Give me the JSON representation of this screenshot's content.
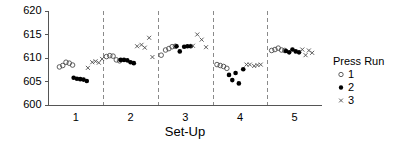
{
  "chart_data": {
    "type": "scatter",
    "title": "",
    "xlabel": "Set-Up",
    "ylabel": "",
    "xlim": [
      0.5,
      5.5
    ],
    "ylim": [
      600,
      620
    ],
    "grid": false,
    "x_tick_labels": [
      "1",
      "2",
      "3",
      "4",
      "5"
    ],
    "x_tick_values": [
      1,
      2,
      3,
      4,
      5
    ],
    "y_tick_labels": [
      "600",
      "605",
      "610",
      "615",
      "620"
    ],
    "y_tick_values": [
      600,
      605,
      610,
      615,
      620
    ],
    "group_dividers": [
      1.5,
      2.5,
      3.5,
      4.5
    ],
    "legend": {
      "title": "Press Run",
      "position": "right",
      "entries": [
        {
          "label": "1",
          "marker": "open-circle"
        },
        {
          "label": "2",
          "marker": "filled-circle"
        },
        {
          "label": "3",
          "marker": "cross"
        }
      ]
    },
    "series": [
      {
        "name": "1",
        "marker": "open-circle",
        "points": [
          {
            "x": 0.7,
            "y": 608.1
          },
          {
            "x": 0.76,
            "y": 608.4
          },
          {
            "x": 0.82,
            "y": 609.1
          },
          {
            "x": 0.88,
            "y": 608.9
          },
          {
            "x": 0.94,
            "y": 608.5
          },
          {
            "x": 1.56,
            "y": 610.3
          },
          {
            "x": 1.62,
            "y": 610.5
          },
          {
            "x": 1.68,
            "y": 610.4
          },
          {
            "x": 1.74,
            "y": 609.6
          },
          {
            "x": 1.8,
            "y": 609.4
          },
          {
            "x": 2.56,
            "y": 610.6
          },
          {
            "x": 2.64,
            "y": 611.7
          },
          {
            "x": 2.7,
            "y": 612.0
          },
          {
            "x": 2.76,
            "y": 612.4
          },
          {
            "x": 2.82,
            "y": 612.5
          },
          {
            "x": 3.58,
            "y": 608.6
          },
          {
            "x": 3.64,
            "y": 608.4
          },
          {
            "x": 3.7,
            "y": 608.2
          },
          {
            "x": 3.76,
            "y": 607.8
          },
          {
            "x": 4.58,
            "y": 611.6
          },
          {
            "x": 4.64,
            "y": 611.8
          },
          {
            "x": 4.7,
            "y": 612.1
          },
          {
            "x": 4.76,
            "y": 611.7
          },
          {
            "x": 4.82,
            "y": 611.6
          }
        ]
      },
      {
        "name": "2",
        "marker": "filled-circle",
        "points": [
          {
            "x": 0.96,
            "y": 605.8
          },
          {
            "x": 1.02,
            "y": 605.6
          },
          {
            "x": 1.08,
            "y": 605.5
          },
          {
            "x": 1.14,
            "y": 605.4
          },
          {
            "x": 1.2,
            "y": 605.1
          },
          {
            "x": 1.82,
            "y": 609.6
          },
          {
            "x": 1.88,
            "y": 609.6
          },
          {
            "x": 1.94,
            "y": 609.5
          },
          {
            "x": 2.0,
            "y": 609.1
          },
          {
            "x": 2.06,
            "y": 608.9
          },
          {
            "x": 2.84,
            "y": 612.5
          },
          {
            "x": 2.9,
            "y": 611.4
          },
          {
            "x": 2.98,
            "y": 612.4
          },
          {
            "x": 3.04,
            "y": 612.5
          },
          {
            "x": 3.1,
            "y": 612.5
          },
          {
            "x": 3.8,
            "y": 606.4
          },
          {
            "x": 3.86,
            "y": 605.3
          },
          {
            "x": 3.92,
            "y": 606.8
          },
          {
            "x": 3.98,
            "y": 604.6
          },
          {
            "x": 4.06,
            "y": 607.6
          },
          {
            "x": 4.84,
            "y": 611.5
          },
          {
            "x": 4.9,
            "y": 611.2
          },
          {
            "x": 4.96,
            "y": 611.8
          },
          {
            "x": 5.02,
            "y": 611.4
          },
          {
            "x": 5.08,
            "y": 611.2
          }
        ]
      },
      {
        "name": "3",
        "marker": "cross",
        "points": [
          {
            "x": 1.22,
            "y": 607.9
          },
          {
            "x": 1.3,
            "y": 609.1
          },
          {
            "x": 1.36,
            "y": 609.3
          },
          {
            "x": 1.42,
            "y": 609.0
          },
          {
            "x": 1.48,
            "y": 609.8
          },
          {
            "x": 2.12,
            "y": 612.5
          },
          {
            "x": 2.2,
            "y": 612.8
          },
          {
            "x": 2.26,
            "y": 612.2
          },
          {
            "x": 2.34,
            "y": 614.3
          },
          {
            "x": 2.4,
            "y": 610.2
          },
          {
            "x": 3.14,
            "y": 612.6
          },
          {
            "x": 3.22,
            "y": 615.0
          },
          {
            "x": 3.3,
            "y": 613.9
          },
          {
            "x": 3.38,
            "y": 612.3
          },
          {
            "x": 4.12,
            "y": 608.6
          },
          {
            "x": 4.18,
            "y": 608.6
          },
          {
            "x": 4.26,
            "y": 608.3
          },
          {
            "x": 4.32,
            "y": 608.5
          },
          {
            "x": 4.38,
            "y": 608.6
          },
          {
            "x": 5.14,
            "y": 611.8
          },
          {
            "x": 5.2,
            "y": 610.6
          },
          {
            "x": 5.26,
            "y": 611.6
          },
          {
            "x": 5.32,
            "y": 611.1
          }
        ]
      }
    ]
  }
}
